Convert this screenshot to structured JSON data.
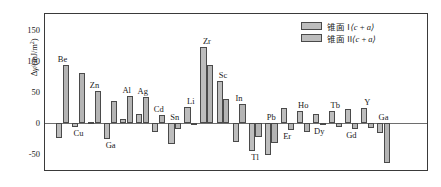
{
  "chart_data": {
    "type": "bar",
    "title": "",
    "xlabel": "",
    "ylabel": "Δγ/(mJ/m²)",
    "ylim": [
      -75,
      165
    ],
    "yticks": [
      150,
      100,
      50,
      0,
      -50
    ],
    "ytick_labels": [
      "150",
      "100",
      "50",
      "0",
      "-50"
    ],
    "grid": false,
    "legend_position": "top-right",
    "categories": [
      "Be",
      "Cu",
      "Zn",
      "Ga",
      "Al",
      "Ag",
      "Cd",
      "Sn",
      "Li",
      "Zr",
      "Sc",
      "In",
      "Tl",
      "Pb",
      "Er",
      "Ho",
      "Dy",
      "Tb",
      "Gd",
      "Y",
      "Ga"
    ],
    "series": [
      {
        "name": "锥面 I⟨c+a⟩",
        "values": [
          -24,
          -6,
          1,
          -25,
          6,
          15,
          -14,
          -34,
          26,
          122,
          68,
          -30,
          -45,
          -51,
          24,
          19,
          14,
          20,
          23,
          24,
          -16
        ]
      },
      {
        "name": "锥面 II⟨c+a⟩",
        "values": [
          93,
          81,
          52,
          36,
          44,
          42,
          13,
          -10,
          -1,
          93,
          38,
          30,
          -22,
          -33,
          -11,
          -14,
          -4,
          -7,
          -10,
          -8,
          -65
        ]
      }
    ],
    "legend": [
      "锥面 I⟨c+a⟩",
      "锥面 II⟨c+a⟩"
    ],
    "group_labels": [
      {
        "text": "Be",
        "category": "Be",
        "placement": "above"
      },
      {
        "text": "Cu",
        "category": "Cu",
        "placement": "below"
      },
      {
        "text": "Zn",
        "category": "Zn",
        "placement": "above"
      },
      {
        "text": "Ga",
        "category": "Ga",
        "placement": "below"
      },
      {
        "text": "Al",
        "category": "Al",
        "placement": "above"
      },
      {
        "text": "Ag",
        "category": "Ag",
        "placement": "above"
      },
      {
        "text": "Cd",
        "category": "Cd",
        "placement": "above"
      },
      {
        "text": "Sn",
        "category": "Sn",
        "placement": "above"
      },
      {
        "text": "Li",
        "category": "Li",
        "placement": "above"
      },
      {
        "text": "Zr",
        "category": "Zr",
        "placement": "above"
      },
      {
        "text": "Sc",
        "category": "Sc",
        "placement": "above"
      },
      {
        "text": "In",
        "category": "In",
        "placement": "above"
      },
      {
        "text": "Tl",
        "category": "Tl",
        "placement": "below"
      },
      {
        "text": "Pb",
        "category": "Pb",
        "placement": "above"
      },
      {
        "text": "Er",
        "category": "Er",
        "placement": "below"
      },
      {
        "text": "Ho",
        "category": "Ho",
        "placement": "above"
      },
      {
        "text": "Dy",
        "category": "Dy",
        "placement": "below"
      },
      {
        "text": "Tb",
        "category": "Tb",
        "placement": "above"
      },
      {
        "text": "Gd",
        "category": "Gd",
        "placement": "below"
      },
      {
        "text": "Y",
        "category": "Y",
        "placement": "above"
      },
      {
        "text": "Ga",
        "category": "Ga2",
        "placement": "above"
      }
    ]
  },
  "axis": {
    "y_label": "Δγ/(mJ/m²)",
    "y_label_delta": "Δ",
    "y_label_gamma": "γ",
    "y_label_units": "/(mJ/m",
    "y_label_exp": "2",
    "tick_150": "150",
    "tick_100": "100",
    "tick_50": "50",
    "tick_0": "0",
    "tick_neg50": "-50"
  },
  "legend": {
    "item1_prefix": "锥面 I",
    "item1_bracket": "⟨c + a⟩",
    "item2_prefix": "锥面 II",
    "item2_bracket": "⟨c + a⟩"
  },
  "colors": {
    "bar_fill": "#bdbdbd",
    "bar_stroke": "#4a4a4a",
    "axis": "#3a3a3a",
    "text": "#1a1a1a",
    "background": "#ffffff"
  }
}
